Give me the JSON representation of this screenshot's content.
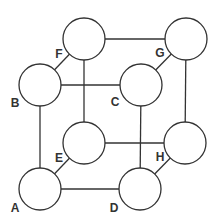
{
  "diagram": {
    "stroke_color": "#333333",
    "node_radius": 21,
    "nodes": [
      {
        "id": "A",
        "label": "A",
        "cx": 40,
        "cy": 189,
        "lx": 15,
        "ly": 208
      },
      {
        "id": "B",
        "label": "B",
        "cx": 40,
        "cy": 85,
        "lx": 15,
        "ly": 103
      },
      {
        "id": "C",
        "label": "C",
        "cx": 141,
        "cy": 85,
        "lx": 115,
        "ly": 102
      },
      {
        "id": "D",
        "label": "D",
        "cx": 140,
        "cy": 189,
        "lx": 114,
        "ly": 208
      },
      {
        "id": "E",
        "label": "E",
        "cx": 84,
        "cy": 143,
        "lx": 59,
        "ly": 158
      },
      {
        "id": "F",
        "label": "F",
        "cx": 84,
        "cy": 39,
        "lx": 59,
        "ly": 54
      },
      {
        "id": "G",
        "label": "G",
        "cx": 186,
        "cy": 39,
        "lx": 160,
        "ly": 53
      },
      {
        "id": "H",
        "label": "H",
        "cx": 185,
        "cy": 143,
        "lx": 160,
        "ly": 157
      }
    ],
    "edges": [
      [
        "A",
        "B"
      ],
      [
        "B",
        "C"
      ],
      [
        "C",
        "D"
      ],
      [
        "A",
        "D"
      ],
      [
        "E",
        "F"
      ],
      [
        "F",
        "G"
      ],
      [
        "G",
        "H"
      ],
      [
        "E",
        "H"
      ],
      [
        "A",
        "E"
      ],
      [
        "B",
        "F"
      ],
      [
        "C",
        "G"
      ],
      [
        "D",
        "H"
      ]
    ]
  }
}
